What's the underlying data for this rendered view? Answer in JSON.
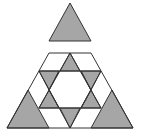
{
  "diagram": {
    "colors": {
      "fill": "#a6a6a6",
      "stroke": "#333333",
      "background": "#ffffff"
    }
  }
}
